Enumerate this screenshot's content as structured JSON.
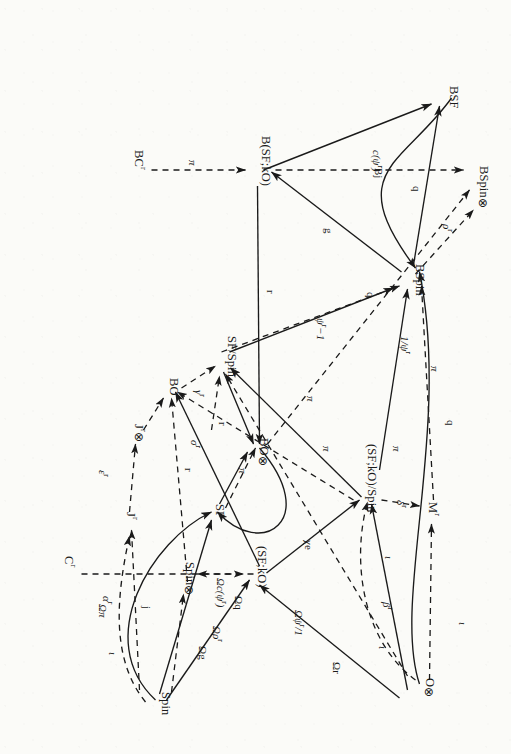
{
  "figure": {
    "kind": "commutative-diagram",
    "orientation_deg": 90
  },
  "nodes": [
    {
      "id": "BSF",
      "label": "BSF"
    },
    {
      "id": "BSpin",
      "label": "BSpin"
    },
    {
      "id": "BSpinT",
      "label": "BSpin",
      "suffix": "⊗"
    },
    {
      "id": "BCr",
      "label": "BC",
      "sup": "r"
    },
    {
      "id": "BSFkO",
      "label": "B(SF;kO)"
    },
    {
      "id": "BO_T",
      "label": "BO",
      "suffix": "⊗"
    },
    {
      "id": "SFSpin",
      "label": "SF/Spin"
    },
    {
      "id": "BO",
      "label": "BO"
    },
    {
      "id": "Mr",
      "label": "M",
      "sup": "r"
    },
    {
      "id": "SFkOSpin",
      "label": "(SF;kO)/Spin"
    },
    {
      "id": "Jr_T",
      "label": "J",
      "sup": "r",
      "suffix": "⊗"
    },
    {
      "id": "SF",
      "label": "SF"
    },
    {
      "id": "O_T",
      "label": "O",
      "suffix": "⊗"
    },
    {
      "id": "Cr",
      "label": "C",
      "sup": "r"
    },
    {
      "id": "SFkO",
      "label": "(SF;kO)"
    },
    {
      "id": "SpinT",
      "label": "Spin",
      "suffix": "⊗"
    },
    {
      "id": "Spin",
      "label": "Spin"
    },
    {
      "id": "Jr",
      "label": "J",
      "sup": "r"
    }
  ],
  "edge_labels": [
    {
      "id": "Bj",
      "text": "Bj",
      "style": "curve-solid"
    },
    {
      "id": "q_top",
      "text": "q",
      "style": "solid"
    },
    {
      "id": "rho_r",
      "text": "ρ",
      "sup": "r",
      "style": "dashed"
    },
    {
      "id": "g",
      "text": "g",
      "style": "solid"
    },
    {
      "id": "c_psi_r",
      "text": "c(ψ",
      "sup": "r",
      "tail": ")",
      "style": "dashed"
    },
    {
      "id": "inv_psi_r",
      "text": "1/ψ",
      "sup": "r",
      "style": "dashed"
    },
    {
      "id": "pi_BC",
      "text": "π",
      "style": "dashed"
    },
    {
      "id": "r_BO",
      "text": "r",
      "style": "solid"
    },
    {
      "id": "q_mid",
      "text": "q",
      "style": "solid"
    },
    {
      "id": "psi_r_m1",
      "text": "ψ",
      "sup": "r",
      "tail": "−1",
      "style": "dashed"
    },
    {
      "id": "pi_BSpin",
      "text": "π",
      "style": "dashed"
    },
    {
      "id": "q_left",
      "text": "q",
      "style": "curve-solid"
    },
    {
      "id": "delta_r",
      "text": "δ",
      "sup": "r",
      "style": "dashed"
    },
    {
      "id": "iota_1",
      "text": "ι",
      "style": "dashed"
    },
    {
      "id": "pi_1",
      "text": "π",
      "style": "solid"
    },
    {
      "id": "pi_2",
      "text": "π",
      "style": "solid"
    },
    {
      "id": "pi_3",
      "text": "π",
      "style": "dashed"
    },
    {
      "id": "beta_r",
      "text": "β",
      "sup": "r",
      "style": "dashed"
    },
    {
      "id": "iota_2",
      "text": "ι",
      "style": "curve-solid"
    },
    {
      "id": "iota_3",
      "text": "ι",
      "style": "dashed"
    },
    {
      "id": "Om_psi_r",
      "text": "Ωψ",
      "sup": "r",
      "tail": "/1",
      "style": "dashed"
    },
    {
      "id": "Om_r",
      "text": "Ωr",
      "style": "solid"
    },
    {
      "id": "Om_pi",
      "text": "Ωπ",
      "style": "dashed"
    },
    {
      "id": "Om_c_psi",
      "text": "Ωc(ψ",
      "sup": "r",
      "tail": ")",
      "style": "dashed"
    },
    {
      "id": "Om_g",
      "text": "Ωg",
      "style": "solid"
    },
    {
      "id": "Om_q",
      "text": "Ωq",
      "style": "solid"
    },
    {
      "id": "Om_rho_r",
      "text": "Ωρ",
      "sup": "r",
      "style": "dashed"
    },
    {
      "id": "gamma_r",
      "text": "γ",
      "sup": "r",
      "style": "dashed"
    },
    {
      "id": "sigma_r",
      "text": "σ",
      "sup": "r",
      "style": "dashed"
    },
    {
      "id": "r_mid",
      "text": "r",
      "style": "solid"
    },
    {
      "id": "r_right",
      "text": "r",
      "style": "solid"
    },
    {
      "id": "pi_BO",
      "text": "π",
      "style": "dashed"
    },
    {
      "id": "eps_r",
      "text": "ε",
      "sup": "r",
      "style": "dashed"
    },
    {
      "id": "alpha_r",
      "text": "α",
      "sup": "r",
      "style": "dashed"
    },
    {
      "id": "iota_4",
      "text": "ι",
      "style": "dashed"
    },
    {
      "id": "chi_e",
      "text": "χe",
      "style": "curve-solid"
    },
    {
      "id": "j",
      "text": "j",
      "style": "curve-solid"
    }
  ],
  "colors": {
    "ink": "#1a1a1a",
    "paper": "#fbfbf8"
  }
}
